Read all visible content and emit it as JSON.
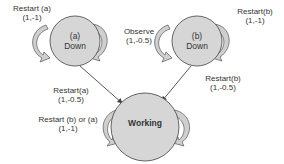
{
  "diagram": {
    "type": "state-transition",
    "colors": {
      "node_fill": "#d6d6d6",
      "node_stroke": "#555555",
      "loop_fill": "#cfcfcf",
      "edge_stroke": "#444444",
      "text": "#333333"
    },
    "nodes": {
      "a_down": {
        "line1": "(a)",
        "line2": "Down"
      },
      "b_down": {
        "line1": "(b)",
        "line2": "Down"
      },
      "working": {
        "label": "Working"
      }
    },
    "edges": {
      "restart_a_self": {
        "action": "Restart (a)",
        "reward": "(1,-1)"
      },
      "observe_self": {
        "action": "Observe",
        "reward": "(1,-0.5)"
      },
      "restart_b_self": {
        "action": "Restart(b)",
        "reward": "(1,-1)"
      },
      "restart_a_to_working": {
        "action": "Restart(a)",
        "reward": "(1,-0.5)"
      },
      "restart_b_to_working": {
        "action": "Restart(b)",
        "reward": "(1,-0.5)"
      },
      "restart_ba_working_self": {
        "action": "Restart (b) or (a)",
        "reward": "(1,-1)"
      }
    }
  }
}
